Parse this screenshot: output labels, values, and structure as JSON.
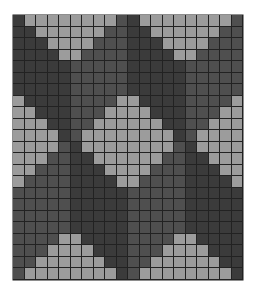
{
  "pattern": {
    "columns": 20,
    "rows": 23,
    "palette": {
      "L": "#9c9c9c",
      "A": "#3b3b3b",
      "B": "#4f4f4f"
    },
    "grid_line_color": "#222222",
    "row_codes": [
      "ALLLLLLLLBALLLLLLLLB",
      "AALLLLLLBBAALLLLLLBB",
      "AAALLLLBBBAAALLLLBBB",
      "AAAALLBBBBAAAALLBBBB",
      "AAAAABBBBBAAAAABBBBB",
      "AAAAABBBBBAAAAABBBBB",
      "AAAAABBBBBAAAAABBBBB",
      "LAAAABBBBLLAAAABBBBL",
      "LLAAABBBLLLLAAABBBLL",
      "LLLAABBLLLLLLAABBLLL",
      "LLLLABLLLLLLLLABLLLL",
      "LLLLBALLLLLLLLBALLLL",
      "LLLBBAALLLLLLBBAALLL",
      "LLBBBAAALLLLBBBAAALL",
      "LBBBBAAAALLBBBBAAAAL",
      "BBBBBAAAAABBBBBAAAAA",
      "BBBBBAAAAABBBBBAAAAA",
      "BBBBBAAAAABBBBBAAAAA",
      "BBBBBAAAAABBBBBAAAAA",
      "BBBBLLAAAABBBBLLAAAA",
      "BBBLLLLAAABBBLLLLAAA",
      "BBLLLLLLAABBLLLLLLAA",
      "BLLLLLLLLABLLLLLLLLA"
    ]
  }
}
